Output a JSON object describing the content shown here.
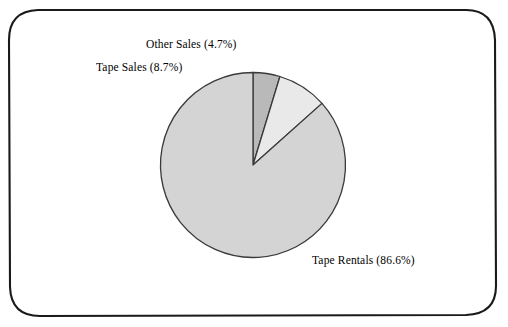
{
  "chart_data": {
    "type": "pie",
    "title": "",
    "subtitle": "",
    "xlabel": "",
    "ylabel": "",
    "legend_position": "none",
    "grid": false,
    "labels_format": "name (percent%)",
    "start_angle_deg": 90,
    "direction": "counterclockwise",
    "categories": [
      "Other Sales",
      "Tape Sales",
      "Tape Rentals"
    ],
    "values": [
      4.7,
      8.7,
      86.6
    ],
    "units": "percent",
    "slices": [
      {
        "name": "Other Sales",
        "value": 4.7,
        "label": "Other Sales (4.7%)",
        "color": "#b9b9b9",
        "order": 1
      },
      {
        "name": "Tape Sales",
        "value": 8.7,
        "label": "Tape Sales (8.7%)",
        "color": "#e9e9e9",
        "order": 2
      },
      {
        "name": "Tape Rentals",
        "value": 86.6,
        "label": "Tape Rentals (86.6%)",
        "color": "#d4d4d4",
        "order": 3
      }
    ]
  },
  "figure": {
    "background_color": "#ffffff",
    "border_color": "#000000",
    "outline_color": "#3a3a3a"
  }
}
